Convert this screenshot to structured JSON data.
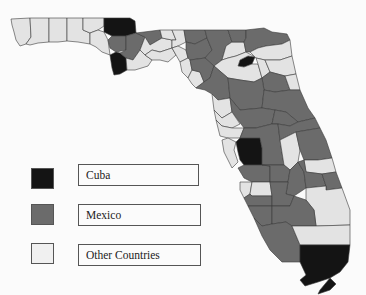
{
  "map": {
    "title": "Florida counties by leading country of origin",
    "colors": {
      "Cuba": "#141414",
      "Mexico": "#6b6b6b",
      "Other Countries": "#e3e3e3",
      "background": "#fbfbfb",
      "border": "#3a3a3a"
    }
  },
  "legend": {
    "items": [
      {
        "label": "Cuba",
        "color": "#141414"
      },
      {
        "label": "Mexico",
        "color": "#6b6b6b"
      },
      {
        "label": "Other Countries",
        "color": "#e3e3e3"
      }
    ]
  }
}
